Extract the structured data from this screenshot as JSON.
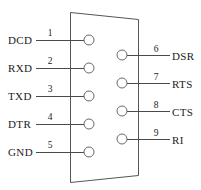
{
  "diagram": {
    "connector": {
      "name": "db9-shell",
      "shape": "trapezoid",
      "outline_color": "#555555"
    },
    "colors": {
      "outline": "#555555",
      "circle_stroke": "#6a6a6a",
      "leader": "#4a4a4a",
      "text": "#1b1b1b",
      "background": "#ffffff"
    },
    "left_column": {
      "name": "left-pin-column",
      "pins": [
        {
          "number": "1",
          "label": "DCD",
          "cx": 89,
          "cy": 40,
          "label_x": 8,
          "label_y": 44,
          "num_x": 50,
          "num_y": 36,
          "line_x1": 36,
          "line_x2": 84
        },
        {
          "number": "2",
          "label": "RXD",
          "cx": 89,
          "cy": 68,
          "label_x": 8,
          "label_y": 72,
          "num_x": 50,
          "num_y": 64,
          "line_x1": 36,
          "line_x2": 84
        },
        {
          "number": "3",
          "label": "TXD",
          "cx": 89,
          "cy": 96,
          "label_x": 8,
          "label_y": 100,
          "num_x": 50,
          "num_y": 92,
          "line_x1": 36,
          "line_x2": 84
        },
        {
          "number": "4",
          "label": "DTR",
          "cx": 89,
          "cy": 124,
          "label_x": 8,
          "label_y": 128,
          "num_x": 50,
          "num_y": 120,
          "line_x1": 36,
          "line_x2": 84
        },
        {
          "number": "5",
          "label": "GND",
          "cx": 89,
          "cy": 152,
          "label_x": 8,
          "label_y": 156,
          "num_x": 50,
          "num_y": 148,
          "line_x1": 36,
          "line_x2": 84
        }
      ]
    },
    "right_column": {
      "name": "right-pin-column",
      "pins": [
        {
          "number": "6",
          "label": "DSR",
          "cx": 122,
          "cy": 55,
          "label_x": 172,
          "label_y": 62,
          "num_x": 156,
          "num_y": 52,
          "line_x1": 127,
          "line_x2": 170
        },
        {
          "number": "7",
          "label": "RTS",
          "cx": 122,
          "cy": 83,
          "label_x": 172,
          "label_y": 90,
          "num_x": 156,
          "num_y": 80,
          "line_x1": 127,
          "line_x2": 170
        },
        {
          "number": "8",
          "label": "CTS",
          "cx": 122,
          "cy": 111,
          "label_x": 172,
          "label_y": 118,
          "num_x": 156,
          "num_y": 108,
          "line_x1": 127,
          "line_x2": 170
        },
        {
          "number": "9",
          "label": "RI",
          "cx": 122,
          "cy": 139,
          "label_x": 172,
          "label_y": 146,
          "num_x": 156,
          "num_y": 136,
          "line_x1": 127,
          "line_x2": 170
        }
      ]
    }
  }
}
